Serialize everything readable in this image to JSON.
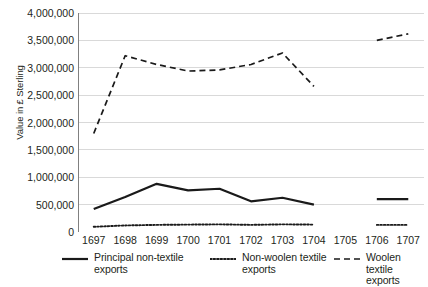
{
  "chart_data": {
    "type": "line",
    "title": "",
    "xlabel": "",
    "ylabel": "Value in £ Sterling",
    "categories": [
      "1697",
      "1698",
      "1699",
      "1700",
      "1701",
      "1702",
      "1703",
      "1704",
      "1705",
      "1706",
      "1707"
    ],
    "ylim": [
      0,
      4000000
    ],
    "yticks": [
      0,
      500000,
      1000000,
      1500000,
      2000000,
      2500000,
      3000000,
      3500000,
      4000000
    ],
    "ytick_labels": [
      "0",
      "500,000",
      "1,000,000",
      "1,500,000",
      "2,000,000",
      "2,500,000",
      "3,000,000",
      "3,500,000",
      "4,000,000"
    ],
    "grid": true,
    "legend_position": "bottom",
    "series": [
      {
        "name": "Principal non-textile exports",
        "style": "solid",
        "color": "#1a1a1a",
        "values": [
          420000,
          640000,
          880000,
          760000,
          790000,
          560000,
          625000,
          500000,
          null,
          600000,
          600000
        ]
      },
      {
        "name": "Non-woolen textile exports",
        "style": "dotted",
        "color": "#1a1a1a",
        "values": [
          95000,
          120000,
          130000,
          135000,
          140000,
          130000,
          140000,
          135000,
          null,
          130000,
          130000
        ]
      },
      {
        "name": "Woolen textile exports",
        "style": "dashed",
        "color": "#1a1a1a",
        "values": [
          1800000,
          3220000,
          3060000,
          2940000,
          2960000,
          3060000,
          3270000,
          2660000,
          null,
          3500000,
          3620000
        ]
      }
    ]
  },
  "legend": {
    "items": [
      {
        "label": "Principal non-textile\nexports",
        "style": "solid"
      },
      {
        "label": "Non-woolen textile\nexports",
        "style": "dotted"
      },
      {
        "label": "Woolen textile\nexports",
        "style": "dashed"
      }
    ]
  },
  "colors": {
    "ink": "#231f20",
    "grid": "#d9d9d9",
    "axis": "#808080",
    "line": "#1a1a1a"
  }
}
